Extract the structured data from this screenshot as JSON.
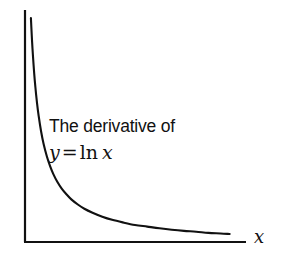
{
  "figure": {
    "background_color": "#ffffff",
    "ink_color": "#111111",
    "annotation": {
      "line1": "The derivative of",
      "line2_variable": "y",
      "line2_equals": "=",
      "line2_function": "ln",
      "line2_argument": "x",
      "line2_plain": "y = ln x"
    },
    "axis_label_x": "x"
  },
  "chart_data": {
    "type": "line",
    "title": "",
    "subtitle": "",
    "xlabel": "x",
    "ylabel": "",
    "annotation_text": "The derivative of y = ln x",
    "function": "y = 1/x",
    "legend": [],
    "legend_position": "none",
    "grid": false,
    "axes": {
      "x_axis_visible": true,
      "y_axis_visible": true,
      "ticks": [],
      "tick_labels": [],
      "xlim": [
        0.12,
        2.65
      ],
      "ylim": [
        0,
        8.4
      ]
    },
    "series": [
      {
        "name": "1/x",
        "color": "#111111",
        "line_width": 2.1,
        "x": [
          0.125,
          0.13,
          0.14,
          0.15,
          0.165,
          0.18,
          0.2,
          0.22,
          0.25,
          0.28,
          0.32,
          0.36,
          0.4,
          0.45,
          0.5,
          0.56,
          0.62,
          0.7,
          0.78,
          0.88,
          1.0,
          1.12,
          1.25,
          1.4,
          1.55,
          1.7,
          1.85,
          2.0,
          2.15,
          2.3,
          2.45,
          2.56
        ],
        "y": [
          8.0,
          7.69,
          7.14,
          6.67,
          6.06,
          5.56,
          5.0,
          4.55,
          4.0,
          3.57,
          3.13,
          2.78,
          2.5,
          2.22,
          2.0,
          1.79,
          1.61,
          1.43,
          1.28,
          1.14,
          1.0,
          0.89,
          0.8,
          0.71,
          0.65,
          0.59,
          0.54,
          0.5,
          0.47,
          0.43,
          0.41,
          0.39
        ]
      }
    ]
  },
  "geometry": {
    "y_axis": {
      "x": 25,
      "y_top": 10,
      "y_bottom": 243
    },
    "x_axis": {
      "y": 242,
      "x_left": 25,
      "x_right": 246
    },
    "curve_start": {
      "x": 30.5,
      "y": 18
    },
    "curve_end": {
      "x": 237,
      "y": 234
    }
  }
}
